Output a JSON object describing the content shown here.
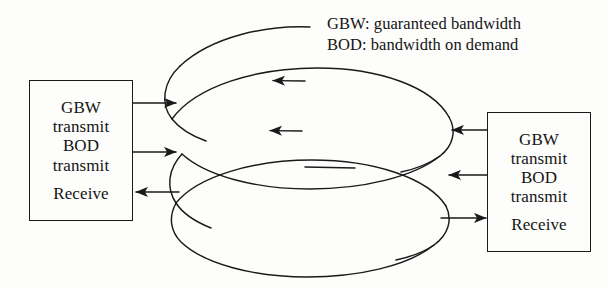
{
  "figure": {
    "background_color": "#fdfdfb",
    "line_color": "#1a1a1a"
  },
  "legend": {
    "lines": [
      "GBW: guaranteed bandwidth",
      "BOD: bandwidth on demand"
    ]
  },
  "nodes": [
    {
      "id": "left-node",
      "lines": [
        "GBW",
        "transmit",
        "BOD",
        "transmit",
        "Receive"
      ]
    },
    {
      "id": "right-node",
      "lines": [
        "GBW",
        "transmit",
        "BOD",
        "transmit",
        "Receive"
      ]
    }
  ],
  "connections": [
    {
      "id": "left-gbw-transmit",
      "from": "left-node",
      "to": "ring-outer",
      "direction": "right"
    },
    {
      "id": "left-bod-transmit",
      "from": "left-node",
      "to": "ring-inner",
      "direction": "right"
    },
    {
      "id": "left-receive",
      "from": "ring-lower",
      "to": "left-node",
      "direction": "left"
    },
    {
      "id": "right-gbw-transmit",
      "from": "right-node",
      "to": "ring-outer",
      "direction": "left"
    },
    {
      "id": "right-bod-transmit",
      "from": "right-node",
      "to": "ring-inner",
      "direction": "left"
    },
    {
      "id": "right-receive",
      "from": "ring-lower",
      "to": "right-node",
      "direction": "right"
    }
  ],
  "ring": {
    "description": "helical coiled ring, two loops, counter-clockwise flow",
    "flow_arrows": 2
  }
}
